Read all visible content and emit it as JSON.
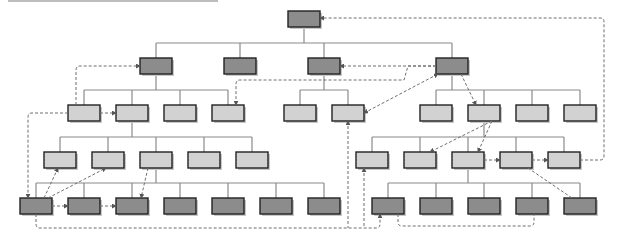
{
  "diagram": {
    "type": "tree-with-cross-links",
    "colors": {
      "dark_node": "#8c8c8c",
      "light_node": "#d2d2d2",
      "border": "#222222",
      "edge": "#8a8a8a",
      "link": "#6f6f6f",
      "shadow": "#c8c8c8"
    },
    "node_w": 32,
    "node_h": 16,
    "nodes": [
      {
        "id": "root",
        "x": 288,
        "y": 11,
        "shade": "dark"
      },
      {
        "id": "a",
        "x": 140,
        "y": 58,
        "shade": "dark",
        "parent": "root"
      },
      {
        "id": "b",
        "x": 224,
        "y": 58,
        "shade": "dark",
        "parent": "root"
      },
      {
        "id": "c",
        "x": 308,
        "y": 58,
        "shade": "dark",
        "parent": "root"
      },
      {
        "id": "d",
        "x": 436,
        "y": 58,
        "shade": "dark",
        "parent": "root"
      },
      {
        "id": "a1",
        "x": 68,
        "y": 105,
        "shade": "light",
        "parent": "a"
      },
      {
        "id": "a2",
        "x": 116,
        "y": 105,
        "shade": "light",
        "parent": "a"
      },
      {
        "id": "a3",
        "x": 164,
        "y": 105,
        "shade": "light",
        "parent": "a"
      },
      {
        "id": "a4",
        "x": 212,
        "y": 105,
        "shade": "light",
        "parent": "a"
      },
      {
        "id": "c1",
        "x": 284,
        "y": 105,
        "shade": "light",
        "parent": "c"
      },
      {
        "id": "c2",
        "x": 332,
        "y": 105,
        "shade": "light",
        "parent": "c"
      },
      {
        "id": "d1",
        "x": 420,
        "y": 105,
        "shade": "light",
        "parent": "d"
      },
      {
        "id": "d2",
        "x": 468,
        "y": 105,
        "shade": "light",
        "parent": "d"
      },
      {
        "id": "d3",
        "x": 516,
        "y": 105,
        "shade": "light",
        "parent": "d"
      },
      {
        "id": "d4",
        "x": 564,
        "y": 105,
        "shade": "light",
        "parent": "d"
      },
      {
        "id": "a21",
        "x": 44,
        "y": 152,
        "shade": "light",
        "parent": "a2"
      },
      {
        "id": "a22",
        "x": 92,
        "y": 152,
        "shade": "light",
        "parent": "a2"
      },
      {
        "id": "a23",
        "x": 140,
        "y": 152,
        "shade": "light",
        "parent": "a2"
      },
      {
        "id": "a24",
        "x": 188,
        "y": 152,
        "shade": "light",
        "parent": "a2"
      },
      {
        "id": "a25",
        "x": 236,
        "y": 152,
        "shade": "light",
        "parent": "a2"
      },
      {
        "id": "d21",
        "x": 356,
        "y": 152,
        "shade": "light",
        "parent": "d2"
      },
      {
        "id": "d22",
        "x": 404,
        "y": 152,
        "shade": "light",
        "parent": "d2"
      },
      {
        "id": "d23",
        "x": 452,
        "y": 152,
        "shade": "light",
        "parent": "d2"
      },
      {
        "id": "d24",
        "x": 500,
        "y": 152,
        "shade": "light",
        "parent": "d2"
      },
      {
        "id": "d25",
        "x": 548,
        "y": 152,
        "shade": "light",
        "parent": "d2"
      },
      {
        "id": "e1",
        "x": 20,
        "y": 198,
        "shade": "dark",
        "parent": "a23"
      },
      {
        "id": "e2",
        "x": 68,
        "y": 198,
        "shade": "dark",
        "parent": "a23"
      },
      {
        "id": "e3",
        "x": 116,
        "y": 198,
        "shade": "dark",
        "parent": "a23"
      },
      {
        "id": "e4",
        "x": 164,
        "y": 198,
        "shade": "dark",
        "parent": "a23"
      },
      {
        "id": "e5",
        "x": 212,
        "y": 198,
        "shade": "dark",
        "parent": "a23"
      },
      {
        "id": "e6",
        "x": 260,
        "y": 198,
        "shade": "dark",
        "parent": "a23"
      },
      {
        "id": "e7",
        "x": 308,
        "y": 198,
        "shade": "dark",
        "parent": "a23"
      },
      {
        "id": "f1",
        "x": 372,
        "y": 198,
        "shade": "dark",
        "parent": "d23"
      },
      {
        "id": "f2",
        "x": 420,
        "y": 198,
        "shade": "dark",
        "parent": "d23"
      },
      {
        "id": "f3",
        "x": 468,
        "y": 198,
        "shade": "dark",
        "parent": "d23"
      },
      {
        "id": "f4",
        "x": 516,
        "y": 198,
        "shade": "dark",
        "parent": "d23"
      },
      {
        "id": "f5",
        "x": 564,
        "y": 198,
        "shade": "dark",
        "parent": "d23"
      }
    ],
    "dashed_links": [
      {
        "from": "a1",
        "to": "a",
        "path": "M76 105 L76 70 Q76 66 80 66 L140 66",
        "arrow": "end"
      },
      {
        "from": "a1",
        "to": "a2",
        "path": "M100 113 L116 113",
        "arrow": "end"
      },
      {
        "from": "a1",
        "to": "e1",
        "path": "M68 113 L32 113 Q28 113 28 117 L28 198",
        "arrow": "end"
      },
      {
        "from": "d",
        "to": "a4",
        "path": "M436 66 L408 66 L404 80 L240 80 Q236 80 236 84 L236 105",
        "arrow": "end"
      },
      {
        "from": "d",
        "to": "c",
        "path": "M436 66 L340 66",
        "arrow": "end"
      },
      {
        "from": "d",
        "to": "c2",
        "path": "M364 113 L438 74",
        "arrow": "both-start-end"
      },
      {
        "from": "d",
        "to": "d2",
        "path": "M461 74 L476 105",
        "arrow": "end"
      },
      {
        "from": "d25",
        "to": "root",
        "path": "M580 160 L600 160 Q604 160 604 156 L604 22 Q604 18 600 18 L320 18",
        "arrow": "end"
      },
      {
        "from": "e1",
        "to": "a21",
        "path": "M44 198 L58 168",
        "arrow": "end"
      },
      {
        "from": "e1",
        "to": "a22",
        "path": "M48 198 L106 168",
        "arrow": "end"
      },
      {
        "from": "a23",
        "to": "e3",
        "path": "M148 168 L141 198",
        "arrow": "end"
      },
      {
        "from": "e1",
        "to": "e2",
        "path": "M52 206 L68 206",
        "arrow": "end"
      },
      {
        "from": "e2",
        "to": "e3",
        "path": "M100 206 L116 206",
        "arrow": "end"
      },
      {
        "from": "e1",
        "to": "f1",
        "path": "M36 214 L36 224 Q36 228 40 228 L376 228 Q380 228 380 224 L380 214",
        "arrow": "end"
      },
      {
        "from": "c2",
        "to": "bottom",
        "path": "M348 121 L348 228",
        "arrow": "start"
      },
      {
        "from": "d21",
        "to": "bottom",
        "path": "M364 168 L364 228",
        "arrow": "start"
      },
      {
        "from": "d",
        "to": "d22",
        "path": "M492 121 L430 152",
        "arrow": "end"
      },
      {
        "from": "d2",
        "to": "d23",
        "path": "M492 121 L478 152",
        "arrow": "end"
      },
      {
        "from": "d23",
        "to": "d24",
        "path": "M484 160 L500 160",
        "arrow": "end"
      },
      {
        "from": "d24",
        "to": "d25",
        "path": "M532 160 L548 160",
        "arrow": "end"
      },
      {
        "from": "d24",
        "to": "f5",
        "path": "M528 168 L572 198",
        "arrow": "none"
      },
      {
        "from": "f1",
        "to": "f4",
        "path": "M398 214 L398 222 Q398 226 402 226 L530 226 Q534 226 534 222 L534 214",
        "arrow": "none"
      }
    ]
  }
}
